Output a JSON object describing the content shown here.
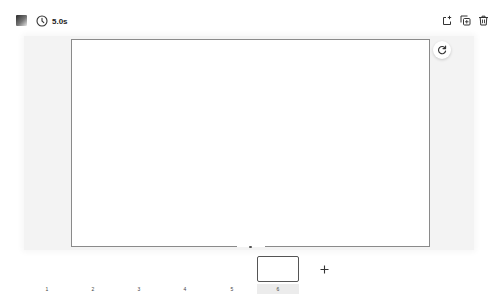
{
  "topbar": {
    "thumbnail_icon": "image-thumbnail",
    "duration": {
      "icon": "clock-icon",
      "value": "5.0s"
    },
    "actions": [
      {
        "name": "add-page",
        "icon": "add-page-icon"
      },
      {
        "name": "duplicate",
        "icon": "duplicate-icon"
      },
      {
        "name": "delete",
        "icon": "trash-icon"
      }
    ]
  },
  "canvas": {
    "background": "#ffffff",
    "border_color": "#8a8a8a",
    "refresh_icon": "refresh-icon"
  },
  "timeline": {
    "frames": [
      {
        "label": "1",
        "active": false
      },
      {
        "label": "2",
        "active": false
      },
      {
        "label": "3",
        "active": false
      },
      {
        "label": "4",
        "active": false
      },
      {
        "label": "5",
        "active": false
      },
      {
        "label": "6",
        "active": true
      }
    ],
    "add_icon": "plus-icon"
  },
  "colors": {
    "stage_background": "#f3f3f3",
    "active_frame_label_bg": "#ececec",
    "icon_color": "#333333"
  }
}
